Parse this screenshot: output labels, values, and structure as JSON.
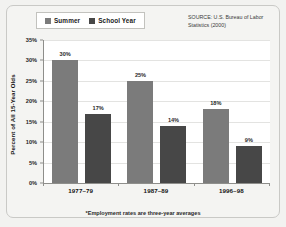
{
  "legend": {
    "entries": [
      {
        "label": "Summer",
        "color": "#7b7b7b",
        "icon": "legend-swatch-icon"
      },
      {
        "label": "School Year",
        "color": "#474747",
        "icon": "legend-swatch-icon"
      }
    ]
  },
  "source_note": "SOURCE: U.S. Bureau of Labor Statistics (2000)",
  "footnote": "*Employment rates are three-year averages",
  "chart_data": {
    "type": "bar",
    "title": "",
    "xlabel": "",
    "ylabel": "Percent of All 15-Year Olds",
    "categories": [
      "1977–79",
      "1987–89",
      "1996–98"
    ],
    "series": [
      {
        "name": "Summer",
        "color": "#7b7b7b",
        "values": [
          30,
          25,
          18
        ],
        "labels": [
          "30%",
          "25%",
          "18%"
        ]
      },
      {
        "name": "School Year",
        "color": "#474747",
        "values": [
          17,
          14,
          9
        ],
        "labels": [
          "17%",
          "14%",
          "9%"
        ]
      }
    ],
    "ylim": [
      0,
      35
    ],
    "ytick_values": [
      0,
      5,
      10,
      15,
      20,
      25,
      30,
      35
    ],
    "ytick_labels": [
      "0%",
      "5%",
      "10%",
      "15%",
      "20%",
      "25%",
      "30%",
      "35%"
    ],
    "grid": true,
    "grid_axis": "y",
    "legend_position": "top-left",
    "plot_background": "#ffffff",
    "figure_background": "#f4f4f2"
  }
}
